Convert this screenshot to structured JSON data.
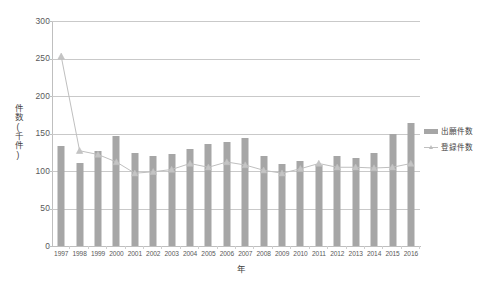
{
  "chart_data": {
    "type": "bar",
    "title": "",
    "subtitle": "",
    "xlabel": "年",
    "ylabel": "件数(千件)",
    "ylim": [
      0,
      300
    ],
    "ytick_labels": [
      "300",
      "250",
      "200",
      "150",
      "100",
      "50",
      "0"
    ],
    "ytick_values": [
      300,
      250,
      200,
      150,
      100,
      50,
      0
    ],
    "grid": true,
    "legend_position": "right",
    "categories": [
      "1997",
      "1998",
      "1999",
      "2000",
      "2001",
      "2002",
      "2003",
      "2004",
      "2005",
      "2006",
      "2007",
      "2008",
      "2009",
      "2010",
      "2011",
      "2012",
      "2013",
      "2014",
      "2015",
      "2016"
    ],
    "series": [
      {
        "name": "出願件数",
        "type": "bar",
        "color": "#a6a6a6",
        "values": [
          133,
          111,
          127,
          147,
          124,
          120,
          123,
          130,
          136,
          139,
          144,
          120,
          110,
          114,
          108,
          120,
          117,
          124,
          150,
          164
        ]
      },
      {
        "name": "登録件数",
        "type": "line",
        "color": "#bfbfbf",
        "marker": "triangle",
        "values": [
          253,
          127,
          122,
          112,
          97,
          99,
          102,
          110,
          105,
          112,
          108,
          101,
          97,
          103,
          110,
          105,
          105,
          104,
          105,
          110
        ]
      }
    ]
  },
  "legend": {
    "items": [
      {
        "label": "出願件数",
        "swatch": "bar"
      },
      {
        "label": "登録件数",
        "swatch": "line-triangle"
      }
    ]
  },
  "colors": {
    "bar": "#a6a6a6",
    "line": "#bfbfbf",
    "grid": "#c9c9c9",
    "axis": "#bfbfbf",
    "text": "#3f3f3f",
    "tick_text": "#595959",
    "background": "#ffffff"
  }
}
